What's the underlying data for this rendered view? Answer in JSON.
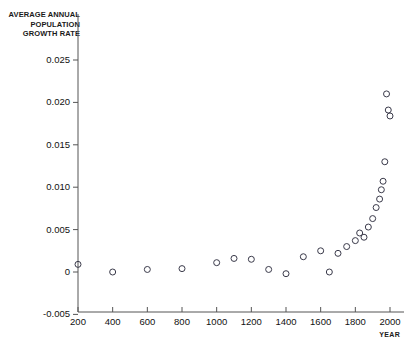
{
  "chart_data": {
    "type": "scatter",
    "title": "",
    "ylabel": "AVERAGE ANNUAL POPULATION GROWTH RATE",
    "ylabel_lines": [
      "AVERAGE ANNUAL",
      "POPULATION",
      "GROWTH RATE"
    ],
    "xlabel": "YEAR",
    "xlim": [
      200,
      2050
    ],
    "ylim": [
      -0.005,
      0.026
    ],
    "xticks": [
      200,
      400,
      600,
      800,
      1000,
      1200,
      1400,
      1600,
      1800,
      2000
    ],
    "xtick_labels": [
      "200",
      "400",
      "600",
      "800",
      "1000",
      "1200",
      "1400",
      "1600",
      "1800",
      "2000"
    ],
    "yticks": [
      0.025,
      0.02,
      0.015,
      0.01,
      0.005,
      0,
      -0.005
    ],
    "ytick_labels": [
      "0.025",
      "0.020",
      "0.015",
      "0.010",
      "0.005",
      "0",
      "-0.005"
    ],
    "grid": false,
    "legend": null,
    "marker": "open-circle",
    "marker_color": "#3a3a4a",
    "axis_color": "#555555",
    "x": [
      200,
      400,
      600,
      800,
      1000,
      1100,
      1200,
      1300,
      1400,
      1500,
      1600,
      1650,
      1700,
      1750,
      1800,
      1825,
      1850,
      1875,
      1900,
      1920,
      1940,
      1950,
      1960,
      1970,
      1980,
      1990,
      2000
    ],
    "y": [
      0.0009,
      0.0,
      0.0003,
      0.0004,
      0.0011,
      0.0016,
      0.0015,
      0.0003,
      -0.0002,
      0.0018,
      0.0025,
      0.0,
      0.0022,
      0.003,
      0.0037,
      0.0046,
      0.0041,
      0.0053,
      0.0063,
      0.0076,
      0.0086,
      0.0097,
      0.0107,
      0.013,
      0.021,
      0.0191,
      0.0184
    ],
    "series_note": "Average annual population growth rate by year"
  }
}
